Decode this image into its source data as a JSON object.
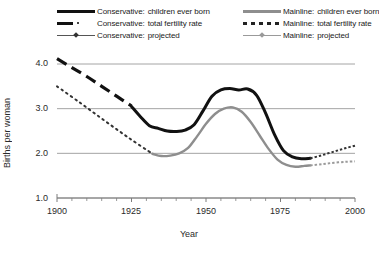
{
  "chart_data": {
    "type": "line",
    "title": "",
    "xlabel": "Year",
    "ylabel": "Births per woman",
    "xlim": [
      1900,
      2000
    ],
    "ylim": [
      1.0,
      4.0
    ],
    "xticks": [
      1900,
      1925,
      1950,
      1975,
      2000
    ],
    "xtick_labels": [
      "1900",
      "1925",
      "1950",
      "1975",
      "2000"
    ],
    "xminor_tick_interval": 5,
    "yticks": [
      1.0,
      2.0,
      3.0,
      4.0
    ],
    "ytick_labels": [
      "1.0",
      "2.0",
      "3.0",
      "4.0"
    ],
    "grid": "horizontal",
    "legend_position": "above-plot",
    "colors": {
      "conservative": "#111111",
      "mainline": "#8e8e8e",
      "gridline": "#9a9a9a",
      "axis": "#7d7d7d",
      "background": "#ffffff"
    },
    "series": [
      {
        "name": "Conservative: total fertility rate",
        "group": "Conservative",
        "style": "dashed-thick",
        "color": "#111111",
        "x": [
          1900,
          1905,
          1910,
          1915,
          1920,
          1925
        ],
        "values": [
          4.12,
          3.92,
          3.72,
          3.5,
          3.28,
          3.06
        ]
      },
      {
        "name": "Conservative: children ever born",
        "group": "Conservative",
        "style": "solid-thick",
        "color": "#111111",
        "x": [
          1925,
          1928,
          1931,
          1934,
          1937,
          1940,
          1943,
          1946,
          1949,
          1952,
          1955,
          1958,
          1961,
          1964,
          1967,
          1970,
          1973,
          1976,
          1979,
          1982,
          1985
        ],
        "values": [
          3.05,
          2.82,
          2.62,
          2.56,
          2.5,
          2.49,
          2.52,
          2.64,
          2.95,
          3.28,
          3.42,
          3.45,
          3.42,
          3.44,
          3.3,
          2.9,
          2.42,
          2.06,
          1.92,
          1.88,
          1.89
        ]
      },
      {
        "name": "Conservative: projected",
        "group": "Conservative",
        "style": "dotted-marker",
        "color": "#333333",
        "x": [
          1985,
          1988,
          1991,
          1994,
          1997,
          2000
        ],
        "values": [
          1.89,
          1.94,
          2.0,
          2.06,
          2.12,
          2.17
        ]
      },
      {
        "name": "Mainline: total fertility rate",
        "group": "Mainline",
        "style": "dotted-thin",
        "color": "#333333",
        "x": [
          1900,
          1908,
          1916,
          1924,
          1932
        ],
        "values": [
          3.5,
          3.12,
          2.73,
          2.35,
          1.99
        ]
      },
      {
        "name": "Mainline: children ever born",
        "group": "Mainline",
        "style": "solid-thin",
        "color": "#8e8e8e",
        "x": [
          1932,
          1935,
          1938,
          1941,
          1944,
          1947,
          1950,
          1953,
          1956,
          1959,
          1962,
          1965,
          1968,
          1971,
          1974,
          1977,
          1980,
          1983,
          1985
        ],
        "values": [
          1.99,
          1.94,
          1.95,
          2.0,
          2.12,
          2.38,
          2.66,
          2.88,
          3.0,
          3.03,
          2.93,
          2.7,
          2.4,
          2.1,
          1.86,
          1.74,
          1.7,
          1.72,
          1.73
        ]
      },
      {
        "name": "Mainline: projected",
        "group": "Mainline",
        "style": "dotted-marker",
        "color": "#9a9a9a",
        "x": [
          1985,
          1989,
          1993,
          1997,
          2000
        ],
        "values": [
          1.73,
          1.76,
          1.79,
          1.81,
          1.82
        ]
      }
    ]
  },
  "legend": {
    "left_column": [
      {
        "group": "Conservative:",
        "label": "children ever born",
        "key": "solid-thick-black"
      },
      {
        "group": "Conservative:",
        "label": "total fertility rate",
        "key": "dashed-thick-black"
      },
      {
        "group": "Conservative:",
        "label": "projected",
        "key": "line-marker-black"
      }
    ],
    "right_column": [
      {
        "group": "Mainline:",
        "label": "children ever born",
        "key": "solid-thick-gray"
      },
      {
        "group": "Mainline:",
        "label": "total fertility rate",
        "key": "dotted-black"
      },
      {
        "group": "Mainline:",
        "label": "projected",
        "key": "line-marker-gray"
      }
    ]
  },
  "axes": {
    "y_title": "Births per woman",
    "x_title": "Year",
    "y_labels": [
      "4.0",
      "3.0",
      "2.0",
      "1.0"
    ],
    "x_labels": [
      "1900",
      "1925",
      "1950",
      "1975",
      "2000"
    ]
  }
}
